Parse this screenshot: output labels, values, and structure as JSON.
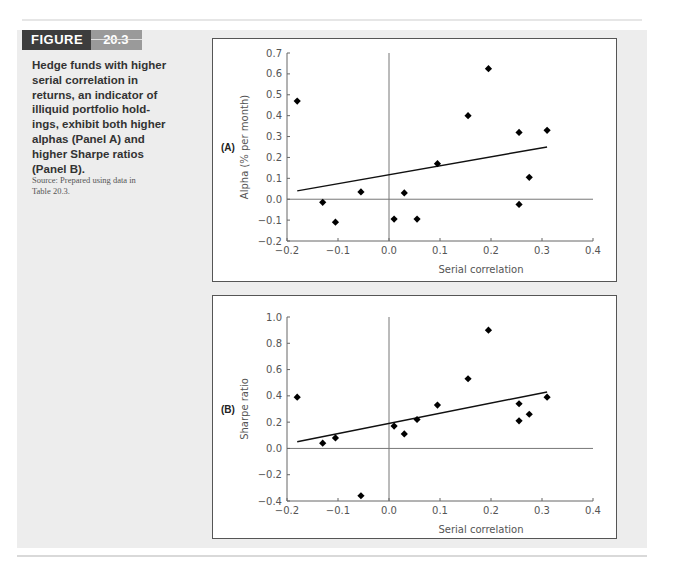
{
  "figure": {
    "label": "FIGURE",
    "number": "20.3",
    "caption": "Hedge funds with higher serial correlation in returns, an indicator of illiquid portfolio holdings, exhibit both higher alphas (Panel A) and higher Sharpe ratios (Panel B).",
    "caption_lines": [
      "Hedge funds with higher",
      "serial correlation in",
      "returns, an indicator of",
      "illiquid portfolio hold-",
      "ings, exhibit both higher",
      "alphas (Panel A) and",
      "higher Sharpe ratios",
      "(Panel B)."
    ],
    "source_lines": [
      "Source: Prepared using data in",
      "Table 20.3."
    ]
  },
  "colors": {
    "header_dark": "#3d3d3d",
    "header_light": "#9a9a9a",
    "figure_bg": "#ededed",
    "points": "#000000",
    "axis": "#666666"
  },
  "chart_data": [
    {
      "type": "scatter",
      "panel": "(A)",
      "title": "",
      "xlabel": "Serial correlation",
      "ylabel": "Alpha (% per month)",
      "xlim": [
        -0.2,
        0.4
      ],
      "ylim": [
        -0.2,
        0.7
      ],
      "xticks": [
        "-0.2",
        "-0.1",
        "0.0",
        "0.1",
        "0.2",
        "0.3",
        "0.4"
      ],
      "yticks": [
        "-0.2",
        "-0.1",
        "0.0",
        "0.1",
        "0.2",
        "0.3",
        "0.4",
        "0.5",
        "0.6",
        "0.7"
      ],
      "grid": false,
      "reference_lines": {
        "x": 0.0,
        "y": 0.0
      },
      "points": [
        {
          "x": -0.18,
          "y": 0.47
        },
        {
          "x": -0.13,
          "y": -0.015
        },
        {
          "x": -0.105,
          "y": -0.11
        },
        {
          "x": -0.055,
          "y": 0.035
        },
        {
          "x": 0.01,
          "y": -0.095
        },
        {
          "x": 0.03,
          "y": 0.03
        },
        {
          "x": 0.055,
          "y": -0.095
        },
        {
          "x": 0.095,
          "y": 0.17
        },
        {
          "x": 0.155,
          "y": 0.4
        },
        {
          "x": 0.195,
          "y": 0.625
        },
        {
          "x": 0.255,
          "y": 0.32
        },
        {
          "x": 0.255,
          "y": -0.025
        },
        {
          "x": 0.275,
          "y": 0.105
        },
        {
          "x": 0.31,
          "y": 0.33
        }
      ],
      "trendline": {
        "x1": -0.18,
        "y1": 0.04,
        "x2": 0.31,
        "y2": 0.25
      }
    },
    {
      "type": "scatter",
      "panel": "(B)",
      "title": "",
      "xlabel": "Serial correlation",
      "ylabel": "Sharpe ratio",
      "xlim": [
        -0.2,
        0.4
      ],
      "ylim": [
        -0.4,
        1.0
      ],
      "xticks": [
        "-0.2",
        "-0.1",
        "0.0",
        "0.1",
        "0.2",
        "0.3",
        "0.4"
      ],
      "yticks": [
        "-0.4",
        "-0.2",
        "0.0",
        "0.2",
        "0.4",
        "0.6",
        "0.8",
        "1.0"
      ],
      "grid": false,
      "reference_lines": {
        "x": 0.0,
        "y": 0.0
      },
      "points": [
        {
          "x": -0.18,
          "y": 0.39
        },
        {
          "x": -0.13,
          "y": 0.04
        },
        {
          "x": -0.105,
          "y": 0.08
        },
        {
          "x": -0.055,
          "y": -0.36
        },
        {
          "x": 0.01,
          "y": 0.17
        },
        {
          "x": 0.03,
          "y": 0.11
        },
        {
          "x": 0.055,
          "y": 0.22
        },
        {
          "x": 0.095,
          "y": 0.33
        },
        {
          "x": 0.155,
          "y": 0.53
        },
        {
          "x": 0.195,
          "y": 0.9
        },
        {
          "x": 0.255,
          "y": 0.34
        },
        {
          "x": 0.255,
          "y": 0.21
        },
        {
          "x": 0.275,
          "y": 0.26
        },
        {
          "x": 0.31,
          "y": 0.39
        }
      ],
      "trendline": {
        "x1": -0.18,
        "y1": 0.05,
        "x2": 0.31,
        "y2": 0.43
      }
    }
  ]
}
